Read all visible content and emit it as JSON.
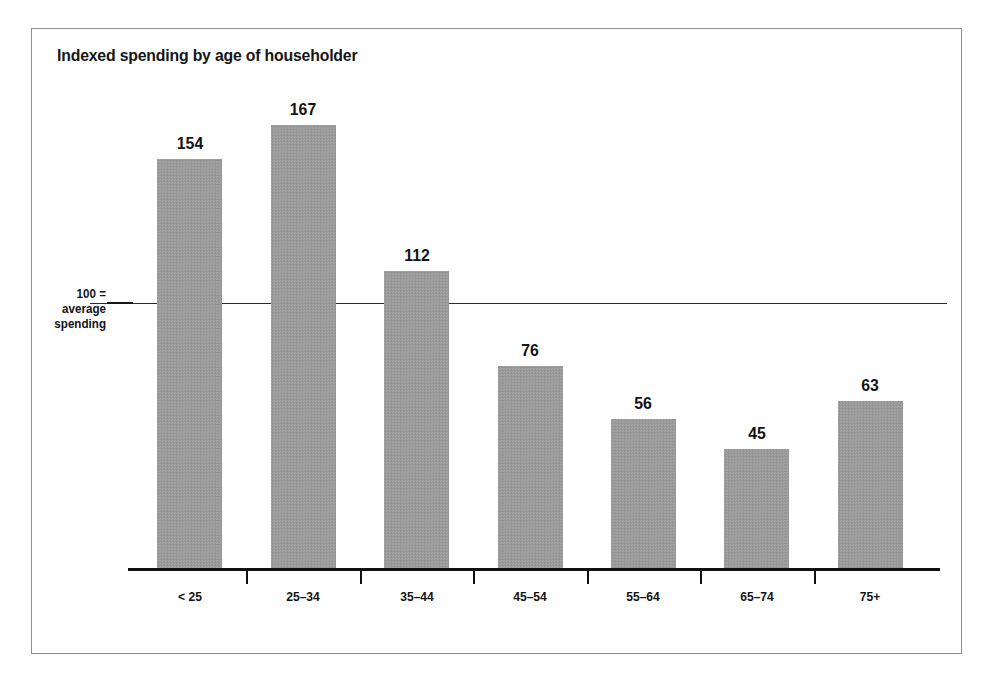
{
  "chart_data": {
    "type": "bar",
    "title": "Indexed spending by age of householder",
    "xlabel": "",
    "ylabel": "",
    "categories": [
      "< 25",
      "25–34",
      "35–44",
      "45–54",
      "55–64",
      "65–74",
      "75+"
    ],
    "values": [
      154,
      167,
      112,
      76,
      56,
      45,
      63
    ],
    "value_labels": [
      "154",
      "167",
      "112",
      "76",
      "56",
      "45",
      "63"
    ],
    "ylim": [
      0,
      175
    ],
    "grid": false,
    "legend": null,
    "reference_line": {
      "value": 100,
      "label_lines": [
        "100 =",
        "average",
        "spending"
      ]
    },
    "colors": {
      "bar_fill": "#9a9a9a",
      "axis": "#101010",
      "text": "#131313",
      "frame_border": "#8d8d8d",
      "background": "#ffffff"
    }
  }
}
